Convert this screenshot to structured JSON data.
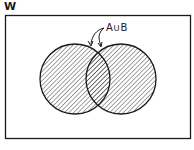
{
  "diagram": {
    "type": "venn",
    "universe_label": "W",
    "sets": [
      {
        "name": "A",
        "cx": 75,
        "cy": 79,
        "r": 35
      },
      {
        "name": "B",
        "cx": 121,
        "cy": 79,
        "r": 35
      }
    ],
    "shaded_region": "A∪B",
    "annotation": {
      "text": "A∪B",
      "arrows_to": [
        "A",
        "B"
      ]
    },
    "colors": {
      "stroke": "#1a1a1a",
      "hatch": "#333333",
      "background": "#ffffff"
    }
  }
}
